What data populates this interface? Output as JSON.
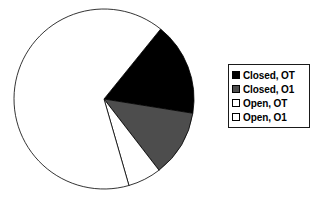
{
  "chart_data": {
    "type": "pie",
    "title": "",
    "categories": [
      "Closed, OT",
      "Closed, O1",
      "Open, OT",
      "Open, O1"
    ],
    "values": [
      16.7,
      12.0,
      6.0,
      65.3
    ],
    "units": "percent",
    "slice_colors": [
      "#000000",
      "#4d4d4d",
      "#ffffff",
      "#ffffff"
    ],
    "slice_edge_color": "#000000",
    "start_angle_deg": -51,
    "direction": "clockwise",
    "legend": {
      "position": "right",
      "border_color": "#1a1a1a",
      "background": "#ffffff",
      "entries": [
        {
          "label": "Closed, OT",
          "swatch_fill": "#000000",
          "swatch_border": "#000000"
        },
        {
          "label": "Closed, O1",
          "swatch_fill": "#4d4d4d",
          "swatch_border": "#000000"
        },
        {
          "label": "Open, OT",
          "swatch_fill": "#ffffff",
          "swatch_border": "#000000"
        },
        {
          "label": "Open, O1",
          "swatch_fill": "#ffffff",
          "swatch_border": "#000000"
        }
      ]
    },
    "grid": false,
    "xlabel": "",
    "ylabel": "",
    "background": "#ffffff"
  },
  "figure": {
    "pie_center_x": 104,
    "pie_center_y": 99,
    "pie_radius": 90
  }
}
